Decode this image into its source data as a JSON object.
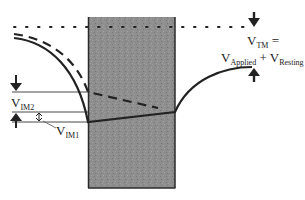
{
  "diagram": {
    "labels": {
      "vtm": {
        "main": "V",
        "sub": "TM",
        "suffix": " ="
      },
      "applied": {
        "main": "V",
        "sub": "Applied"
      },
      "plus": " + ",
      "resting": {
        "main": "V",
        "sub": "Resting"
      },
      "vim2": {
        "main": "V",
        "sub": "IM2"
      },
      "vim1": {
        "main": "V",
        "sub": "IM1"
      }
    },
    "elements": {
      "membrane": {
        "fill": "#8c8c8c",
        "border": "#2a2a2a"
      },
      "reference_line": "dotted",
      "solid_curve": "potential-after",
      "dashed_curve": "potential-before"
    },
    "colors": {
      "line": "#222222",
      "membrane": "#8e8e8e",
      "background": "#ffffff"
    }
  }
}
